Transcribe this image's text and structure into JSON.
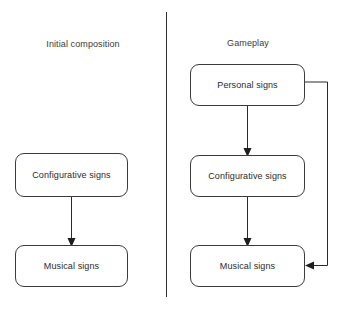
{
  "diagram": {
    "panels": [
      {
        "id": "initial",
        "title": "Initial composition"
      },
      {
        "id": "gameplay",
        "title": "Gameplay"
      }
    ],
    "nodes": [
      {
        "id": "left-configurative",
        "label": "Configurative signs",
        "panel": "initial"
      },
      {
        "id": "left-musical",
        "label": "Musical signs",
        "panel": "initial"
      },
      {
        "id": "right-personal",
        "label": "Personal signs",
        "panel": "gameplay"
      },
      {
        "id": "right-configurative",
        "label": "Configurative signs",
        "panel": "gameplay"
      },
      {
        "id": "right-musical",
        "label": "Musical signs",
        "panel": "gameplay"
      }
    ],
    "edges": [
      {
        "id": "edge-left-conf-to-musical",
        "from": "left-configurative",
        "to": "left-musical",
        "kind": "straight-down"
      },
      {
        "id": "edge-right-personal-to-conf",
        "from": "right-personal",
        "to": "right-configurative",
        "kind": "straight-down"
      },
      {
        "id": "edge-right-conf-to-musical",
        "from": "right-configurative",
        "to": "right-musical",
        "kind": "straight-down"
      },
      {
        "id": "edge-right-personal-feedback",
        "from": "right-personal",
        "to": "right-musical",
        "kind": "right-side-loop"
      }
    ],
    "colors": {
      "stroke": "#2a2a2a",
      "node_border": "#3c3c3c",
      "node_fill": "#ffffff",
      "text": "#2b2b2b",
      "divider": "#2f2f2f",
      "background": "#ffffff"
    }
  }
}
